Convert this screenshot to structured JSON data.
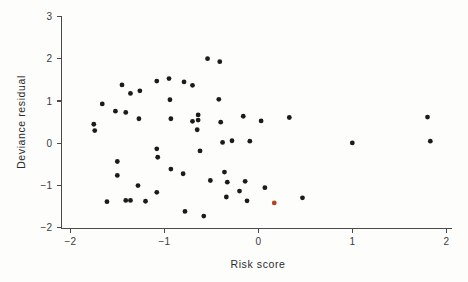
{
  "chart_data": {
    "type": "scatter",
    "title": "",
    "xlabel": "Risk  score",
    "ylabel": "Deviance residual",
    "xlim": [
      -2.2,
      2.05
    ],
    "ylim": [
      -2.1,
      3.15
    ],
    "xticks": [
      -2,
      -1,
      0,
      1,
      2
    ],
    "xticklabels": [
      "−2",
      "−1",
      "0",
      "1",
      "2"
    ],
    "yticks": [
      -2,
      -1,
      0,
      1,
      2,
      3
    ],
    "yticklabels": [
      "−2",
      "−1",
      "0",
      "1",
      "2",
      "3"
    ],
    "grid": false,
    "legend": null,
    "marker": "filled-circle",
    "marker_size": 2.4,
    "point_color": "#1b1b1b",
    "highlight_color": "#b5431c",
    "axis_color": "#4a4a4a",
    "background_color": "#fdfdfc",
    "n_points": 56,
    "series": [
      {
        "name": "deviance residuals",
        "color": "#1b1b1b",
        "points": [
          [
            -1.66,
            0.93
          ],
          [
            -1.75,
            0.45
          ],
          [
            -1.74,
            0.3
          ],
          [
            -1.61,
            -1.38
          ],
          [
            -1.45,
            1.38
          ],
          [
            -1.52,
            0.76
          ],
          [
            -1.41,
            0.73
          ],
          [
            -1.36,
            1.18
          ],
          [
            -1.26,
            1.24
          ],
          [
            -1.5,
            -0.43
          ],
          [
            -1.5,
            -0.76
          ],
          [
            -1.41,
            -1.35
          ],
          [
            -1.36,
            -1.35
          ],
          [
            -1.28,
            -1.0
          ],
          [
            -1.27,
            0.58
          ],
          [
            -1.2,
            -1.37
          ],
          [
            -1.08,
            1.47
          ],
          [
            -1.08,
            -0.13
          ],
          [
            -1.07,
            -0.33
          ],
          [
            -1.08,
            -1.16
          ],
          [
            -0.95,
            1.53
          ],
          [
            -0.94,
            1.03
          ],
          [
            -0.93,
            0.58
          ],
          [
            -0.93,
            -0.61
          ],
          [
            -0.79,
            1.45
          ],
          [
            -0.8,
            -0.72
          ],
          [
            -0.78,
            -1.61
          ],
          [
            -0.7,
            1.37
          ],
          [
            -0.7,
            0.52
          ],
          [
            -0.64,
            0.55
          ],
          [
            -0.64,
            0.67
          ],
          [
            -0.65,
            0.32
          ],
          [
            -0.62,
            -0.18
          ],
          [
            -0.58,
            -1.72
          ],
          [
            -0.54,
            2.0
          ],
          [
            -0.51,
            -0.88
          ],
          [
            -0.41,
            1.93
          ],
          [
            -0.42,
            1.04
          ],
          [
            -0.4,
            0.5
          ],
          [
            -0.38,
            0.02
          ],
          [
            -0.36,
            -0.68
          ],
          [
            -0.34,
            -1.27
          ],
          [
            -0.33,
            -0.92
          ],
          [
            -0.28,
            0.06
          ],
          [
            -0.2,
            -1.13
          ],
          [
            -0.16,
            0.64
          ],
          [
            -0.14,
            -0.9
          ],
          [
            -0.12,
            -1.36
          ],
          [
            -0.09,
            0.05
          ],
          [
            0.03,
            0.53
          ],
          [
            0.07,
            -1.05
          ],
          [
            0.33,
            0.61
          ],
          [
            0.47,
            -1.29
          ],
          [
            1.0,
            0.01
          ],
          [
            1.8,
            0.62
          ],
          [
            1.83,
            0.05
          ]
        ]
      },
      {
        "name": "highlighted observation",
        "color": "#b5431c",
        "points": [
          [
            0.17,
            -1.41
          ]
        ]
      }
    ]
  },
  "figure": {
    "axis_label_x": "Risk  score",
    "axis_label_y": "Deviance residual"
  }
}
